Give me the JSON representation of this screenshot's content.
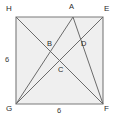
{
  "figure": {
    "kind": "square-with-cevians",
    "colors": {
      "stroke": "#6b6b6b",
      "square_stroke": "#7a7a7a",
      "fill": "#efefef",
      "label": "#2b2b2b",
      "background": "#ffffff"
    },
    "square": {
      "corners": [
        {
          "id": "H",
          "label": "H",
          "x": 16,
          "y": 17
        },
        {
          "id": "E",
          "label": "E",
          "x": 103,
          "y": 17
        },
        {
          "id": "F",
          "label": "F",
          "x": 103,
          "y": 104
        },
        {
          "id": "G",
          "label": "G",
          "x": 16,
          "y": 104
        }
      ]
    },
    "points": [
      {
        "id": "A",
        "label": "A",
        "x": 73,
        "y": 17,
        "label_x": 69,
        "label_y": 4,
        "on": "top-edge"
      },
      {
        "id": "B",
        "label": "B",
        "x": 46,
        "y": 47,
        "label_x": 47,
        "label_y": 41,
        "on": "interior"
      },
      {
        "id": "C",
        "label": "C",
        "x": 58,
        "y": 68,
        "label_x": 58,
        "label_y": 67,
        "on": "interior"
      },
      {
        "id": "D",
        "label": "D",
        "x": 79,
        "y": 46,
        "label_x": 81,
        "label_y": 41,
        "on": "interior"
      }
    ],
    "vertex_labels": [
      {
        "id": "H",
        "text": "H",
        "x": 6,
        "y": 5
      },
      {
        "id": "E",
        "text": "E",
        "x": 104,
        "y": 5
      },
      {
        "id": "G",
        "text": "G",
        "x": 6,
        "y": 105
      },
      {
        "id": "F",
        "text": "F",
        "x": 104,
        "y": 105
      }
    ],
    "segments": [
      {
        "id": "HF",
        "from": "H",
        "to": "F"
      },
      {
        "id": "GE",
        "from": "G",
        "to": "E"
      },
      {
        "id": "AG",
        "from": "A",
        "to": "G"
      },
      {
        "id": "AF",
        "from": "A",
        "to": "F"
      }
    ],
    "side_labels": [
      {
        "id": "left-side",
        "text": "6",
        "x": 5,
        "y": 56,
        "side": "HG"
      },
      {
        "id": "bottom-side",
        "text": "6",
        "x": 57,
        "y": 107,
        "side": "GF"
      }
    ]
  }
}
